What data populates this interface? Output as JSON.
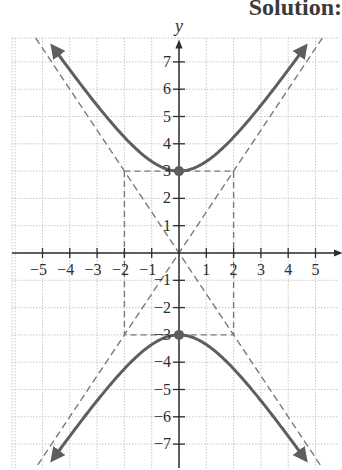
{
  "header": {
    "title": "Solution:"
  },
  "colors": {
    "curve": "#5e5e5e",
    "asymptote": "#7a7a7a",
    "axis": "#2e2e2e",
    "grid": "#c8c8c8",
    "vertex": "#5e5e5e"
  },
  "chart_data": {
    "type": "line",
    "title": "Solution:",
    "xlabel": "",
    "ylabel": "y",
    "xlim": [
      -6.5,
      6
    ],
    "ylim": [
      -8,
      8.5
    ],
    "grid": true,
    "x_ticks": [
      -5,
      -4,
      -3,
      -2,
      -1,
      1,
      2,
      3,
      4,
      5
    ],
    "y_ticks": [
      -7,
      -6,
      -5,
      -4,
      -3,
      -2,
      -1,
      1,
      2,
      3,
      4,
      5,
      6,
      7
    ],
    "x_tick_labels": [
      "−5",
      "−4",
      "−3",
      "−2",
      "−1",
      "1",
      "2",
      "3",
      "4",
      "5"
    ],
    "y_tick_labels": [
      "−7",
      "−6",
      "−5",
      "−4",
      "−3",
      "−2",
      "−1",
      "1",
      "2",
      "3",
      "4",
      "5",
      "6",
      "7"
    ],
    "series": [
      {
        "name": "hyperbola upper branch",
        "equation": "y^2/9 - x^2/4 = 1 (y > 0)",
        "style": "solid",
        "arrows": true
      },
      {
        "name": "hyperbola lower branch",
        "equation": "y^2/9 - x^2/4 = 1 (y < 0)",
        "style": "solid",
        "arrows": true
      },
      {
        "name": "asymptote",
        "equation": "y = 1.5x",
        "style": "dashed"
      },
      {
        "name": "asymptote",
        "equation": "y = -1.5x",
        "style": "dashed"
      },
      {
        "name": "fundamental rectangle",
        "corners": [
          [
            -2,
            3
          ],
          [
            2,
            3
          ],
          [
            2,
            -3
          ],
          [
            -2,
            -3
          ]
        ],
        "style": "dashed"
      }
    ],
    "points": [
      {
        "label": "vertex",
        "x": 0,
        "y": 3
      },
      {
        "label": "vertex",
        "x": 0,
        "y": -3
      }
    ]
  }
}
